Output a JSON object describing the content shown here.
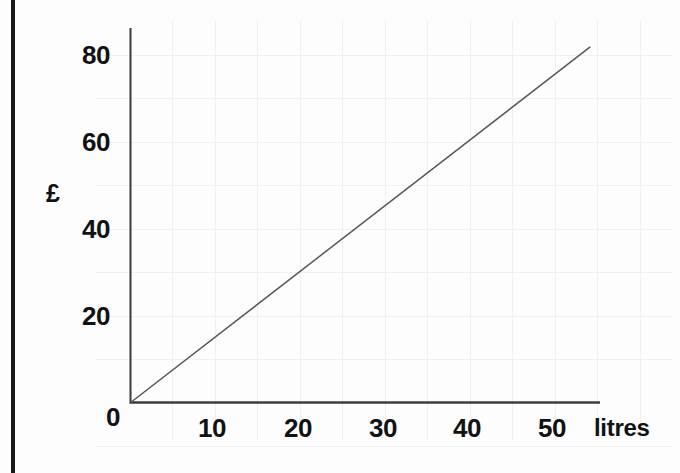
{
  "page": {
    "background_color": "#fdfdfd",
    "edge_bar_color": "#17181a"
  },
  "chart_data": {
    "type": "line",
    "title": "",
    "subtitle": "",
    "xlabel": "litres",
    "ylabel": "£",
    "origin_label": "0",
    "xlim": [
      0,
      55.3
    ],
    "ylim": [
      0,
      86
    ],
    "xticks": [
      10,
      20,
      30,
      40,
      50
    ],
    "xtick_labels": [
      "10",
      "20",
      "30",
      "40",
      "50"
    ],
    "yticks": [
      20,
      40,
      60,
      80
    ],
    "ytick_labels": [
      "20",
      "40",
      "60",
      "80"
    ],
    "grid": true,
    "grid_x_step": 5,
    "grid_y_step": 10,
    "grid_color": "#eff0f1",
    "axis_color": "#3a3c40",
    "legend": "none",
    "series": [
      {
        "name": "cost of fuel",
        "color": "#55585c",
        "x": [
          0,
          54.1
        ],
        "y": [
          0,
          81.8
        ],
        "slope_pounds_per_litre": 1.51,
        "points": [
          {
            "x": 0,
            "y": 0
          },
          {
            "x": 10,
            "y": 15.1
          },
          {
            "x": 20,
            "y": 30.2
          },
          {
            "x": 30,
            "y": 45.3
          },
          {
            "x": 40,
            "y": 60.5
          },
          {
            "x": 50,
            "y": 75.6
          },
          {
            "x": 54.1,
            "y": 81.8
          }
        ]
      }
    ]
  },
  "geometry": {
    "origin_px": {
      "x": 130,
      "y": 403
    },
    "x_axis_end_px": 600,
    "y_axis_top_px": 28,
    "px_per_litre": 8.5,
    "px_per_pound": 4.35
  }
}
